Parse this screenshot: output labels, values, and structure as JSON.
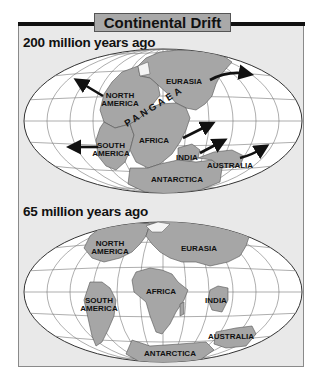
{
  "title": "Continental Drift",
  "maps": [
    {
      "heading": "200 million years ago",
      "supercontinent": "PANGAEA",
      "labels": {
        "north_america_1": "NORTH",
        "north_america_2": "AMERICA",
        "south_america_1": "SOUTH",
        "south_america_2": "AMERICA",
        "eurasia": "EURASIA",
        "africa": "AFRICA",
        "india": "INDIA",
        "australia": "AUSTRALIA",
        "antarctica": "ANTARCTICA"
      },
      "arrows": [
        "north-america-northwest",
        "south-america-west",
        "eurasia-east",
        "africa-northeast",
        "india-northeast",
        "australia-northeast"
      ]
    },
    {
      "heading": "65 million years ago",
      "labels": {
        "north_america_1": "NORTH",
        "north_america_2": "AMERICA",
        "south_america_1": "SOUTH",
        "south_america_2": "AMERICA",
        "eurasia": "EURASIA",
        "africa": "AFRICA",
        "india": "INDIA",
        "australia": "AUSTRALIA",
        "antarctica": "ANTARCTICA"
      }
    }
  ],
  "colors": {
    "land": "#a6a6a6",
    "ocean": "#ffffff",
    "panel": "#e9e9e9",
    "title_box": "#a9a9a9",
    "bar": "#111111"
  }
}
